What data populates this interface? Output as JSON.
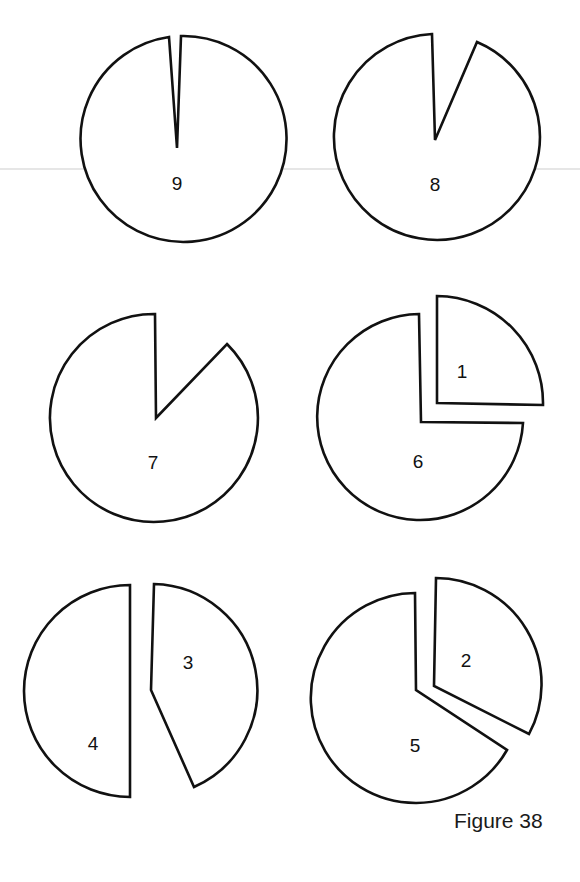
{
  "figure": {
    "caption": "Figure 38",
    "pieces": [
      {
        "label": "9",
        "shape": "circle with thin wedge removed"
      },
      {
        "label": "8",
        "shape": "circle with small wedge removed"
      },
      {
        "label": "7",
        "shape": "circle with larger wedge removed"
      },
      {
        "label": "6",
        "shape": "three-quarter circle"
      },
      {
        "label": "1",
        "shape": "quarter circle piece"
      },
      {
        "label": "4",
        "shape": "half circle"
      },
      {
        "label": "3",
        "shape": "sector piece"
      },
      {
        "label": "5",
        "shape": "circle with sector removed"
      },
      {
        "label": "2",
        "shape": "sector piece"
      }
    ]
  }
}
